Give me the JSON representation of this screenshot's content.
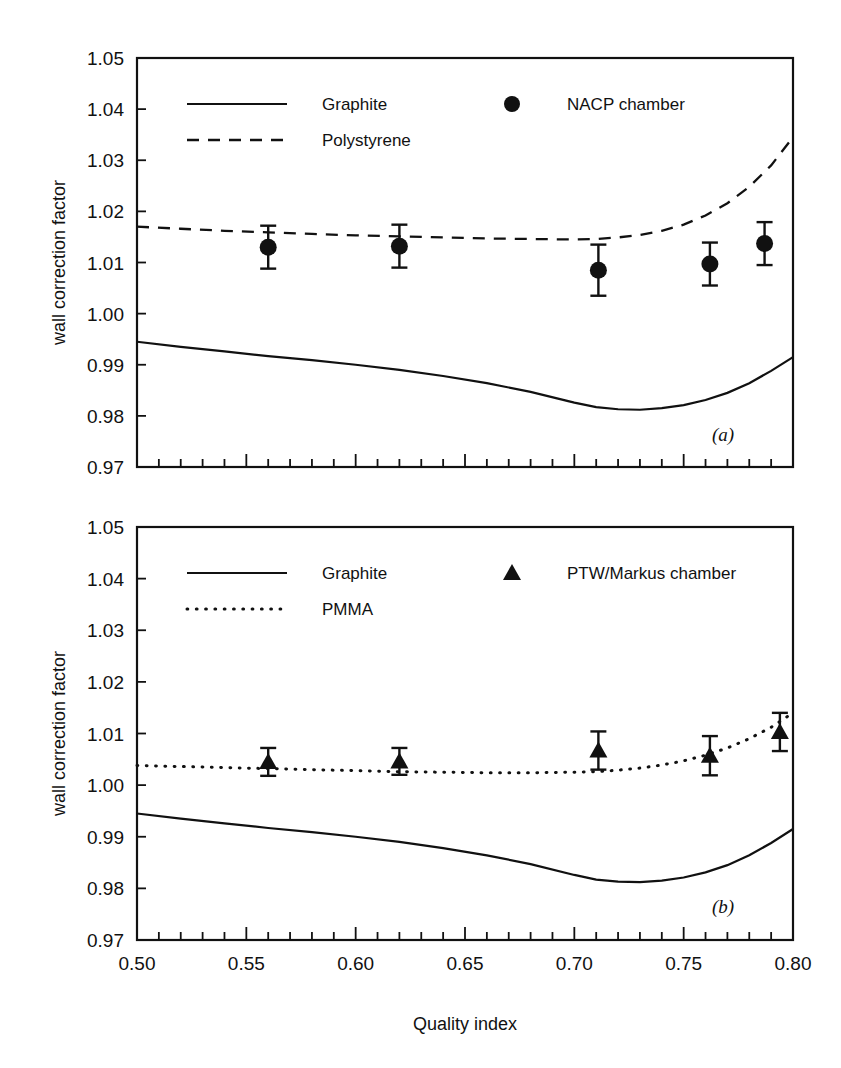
{
  "figure": {
    "xlabel": "Quality index",
    "panel_a_label": "(a)",
    "panel_b_label": "(b)"
  },
  "chart_data": [
    {
      "type": "line",
      "panel": "(a)",
      "title": "",
      "xlabel": "Quality index",
      "ylabel": "wall correction factor",
      "xlim": [
        0.5,
        0.8
      ],
      "ylim": [
        0.97,
        1.05
      ],
      "xticks": [
        0.5,
        0.55,
        0.6,
        0.65,
        0.7,
        0.75,
        0.8
      ],
      "xtick_labels": [
        "0.50",
        "0.55",
        "0.60",
        "0.65",
        "0.70",
        "0.75",
        "0.80"
      ],
      "yticks": [
        0.97,
        0.98,
        0.99,
        1.0,
        1.01,
        1.02,
        1.03,
        1.04,
        1.05
      ],
      "ytick_labels": [
        "0.97",
        "0.98",
        "0.99",
        "1.00",
        "1.01",
        "1.02",
        "1.03",
        "1.04",
        "1.05"
      ],
      "minor_xtick_step": 0.01,
      "grid": false,
      "legend_position": "upper-left-and-upper-center",
      "series": [
        {
          "name": "Graphite",
          "style": "solid",
          "x": [
            0.5,
            0.52,
            0.54,
            0.56,
            0.58,
            0.6,
            0.62,
            0.64,
            0.66,
            0.68,
            0.7,
            0.71,
            0.72,
            0.73,
            0.74,
            0.75,
            0.76,
            0.77,
            0.78,
            0.79,
            0.8
          ],
          "values": [
            0.9945,
            0.9935,
            0.9926,
            0.9917,
            0.9909,
            0.99,
            0.989,
            0.9878,
            0.9864,
            0.9847,
            0.9826,
            0.9817,
            0.9813,
            0.9812,
            0.9815,
            0.9821,
            0.9831,
            0.9845,
            0.9864,
            0.9888,
            0.9915
          ]
        },
        {
          "name": "Polystyrene",
          "style": "dashed",
          "x": [
            0.5,
            0.52,
            0.54,
            0.56,
            0.58,
            0.6,
            0.62,
            0.64,
            0.66,
            0.68,
            0.7,
            0.71,
            0.72,
            0.73,
            0.74,
            0.75,
            0.76,
            0.77,
            0.78,
            0.79,
            0.8
          ],
          "values": [
            1.017,
            1.0166,
            1.0162,
            1.0159,
            1.0156,
            1.0153,
            1.0151,
            1.0149,
            1.0147,
            1.0146,
            1.0145,
            1.0146,
            1.0149,
            1.0154,
            1.0162,
            1.0174,
            1.0192,
            1.0216,
            1.0248,
            1.029,
            1.0345
          ]
        },
        {
          "name": "NACP chamber",
          "style": "marker",
          "marker": "circle",
          "x": [
            0.56,
            0.62,
            0.711,
            0.762,
            0.787
          ],
          "values": [
            1.013,
            1.0132,
            1.0085,
            1.0097,
            1.0137
          ],
          "yerr": [
            0.0042,
            0.0042,
            0.005,
            0.0042,
            0.0042
          ]
        }
      ]
    },
    {
      "type": "line",
      "panel": "(b)",
      "title": "",
      "xlabel": "Quality index",
      "ylabel": "wall correction  factor",
      "xlim": [
        0.5,
        0.8
      ],
      "ylim": [
        0.97,
        1.05
      ],
      "xticks": [
        0.5,
        0.55,
        0.6,
        0.65,
        0.7,
        0.75,
        0.8
      ],
      "xtick_labels": [
        "0.50",
        "0.55",
        "0.60",
        "0.65",
        "0.70",
        "0.75",
        "0.80"
      ],
      "yticks": [
        0.97,
        0.98,
        0.99,
        1.0,
        1.01,
        1.02,
        1.03,
        1.04,
        1.05
      ],
      "ytick_labels": [
        "0.97",
        "0.98",
        "0.99",
        "1.00",
        "1.01",
        "1.02",
        "1.03",
        "1.04",
        "1.05"
      ],
      "minor_xtick_step": 0.01,
      "grid": false,
      "legend_position": "upper-left-and-upper-center",
      "series": [
        {
          "name": "Graphite",
          "style": "solid",
          "x": [
            0.5,
            0.52,
            0.54,
            0.56,
            0.58,
            0.6,
            0.62,
            0.64,
            0.66,
            0.68,
            0.7,
            0.71,
            0.72,
            0.73,
            0.74,
            0.75,
            0.76,
            0.77,
            0.78,
            0.79,
            0.8
          ],
          "values": [
            0.9945,
            0.9935,
            0.9926,
            0.9917,
            0.9909,
            0.99,
            0.989,
            0.9878,
            0.9864,
            0.9847,
            0.9826,
            0.9817,
            0.9813,
            0.9812,
            0.9815,
            0.9821,
            0.9831,
            0.9845,
            0.9864,
            0.9888,
            0.9915
          ]
        },
        {
          "name": "PMMA",
          "style": "dotted",
          "x": [
            0.5,
            0.52,
            0.54,
            0.56,
            0.58,
            0.6,
            0.62,
            0.64,
            0.66,
            0.68,
            0.7,
            0.71,
            0.72,
            0.73,
            0.74,
            0.75,
            0.76,
            0.77,
            0.78,
            0.79,
            0.8
          ],
          "values": [
            1.0038,
            1.0036,
            1.0034,
            1.0032,
            1.003,
            1.0028,
            1.0026,
            1.0025,
            1.0024,
            1.0024,
            1.0025,
            1.0026,
            1.0029,
            1.0033,
            1.0039,
            1.0047,
            1.0058,
            1.0072,
            1.009,
            1.0112,
            1.014
          ]
        },
        {
          "name": "PTW/Markus chamber",
          "style": "marker",
          "marker": "triangle",
          "x": [
            0.56,
            0.62,
            0.711,
            0.762,
            0.794
          ],
          "values": [
            1.0045,
            1.0046,
            1.0067,
            1.0057,
            1.0103
          ],
          "yerr": [
            0.0027,
            0.0026,
            0.0037,
            0.0038,
            0.0037
          ]
        }
      ]
    }
  ],
  "panels": [
    {
      "id": "a",
      "label": "(a)",
      "ylabel": "wall correction factor",
      "legend": [
        {
          "label": "Graphite",
          "style": "solid"
        },
        {
          "label": "Polystyrene",
          "style": "dashed"
        },
        {
          "label": "NACP chamber",
          "style": "marker-circle"
        }
      ]
    },
    {
      "id": "b",
      "label": "(b)",
      "ylabel": "wall correction  factor",
      "legend": [
        {
          "label": "Graphite",
          "style": "solid"
        },
        {
          "label": "PMMA",
          "style": "dotted"
        },
        {
          "label": "PTW/Markus chamber",
          "style": "marker-triangle"
        }
      ]
    }
  ],
  "colors": {
    "ink": "#111111",
    "background": "#ffffff"
  }
}
